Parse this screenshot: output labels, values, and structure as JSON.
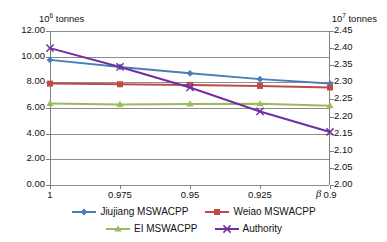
{
  "chart_data": {
    "type": "line",
    "title": "",
    "xlabel": "β",
    "categories": [
      "1",
      "0.975",
      "0.95",
      "0.925",
      "0.9"
    ],
    "x": [
      1,
      0.975,
      0.95,
      0.925,
      0.9
    ],
    "left_axis": {
      "unit_caption": "tonnes",
      "unit_base": "10",
      "unit_exponent": "6",
      "ticks": [
        "12.00",
        "10.00",
        "8.00",
        "6.00",
        "4.00",
        "2.00",
        "0.00"
      ],
      "ylim": [
        0.0,
        12.0
      ],
      "step": 2.0
    },
    "right_axis": {
      "unit_caption": "tonnes",
      "unit_base": "10",
      "unit_exponent": "7",
      "ticks": [
        "2.45",
        "2.40",
        "2.35",
        "2.30",
        "2.25",
        "2.20",
        "2.15",
        "2.10",
        "2.05",
        "2.00"
      ],
      "ylim": [
        2.0,
        2.45
      ],
      "step": 0.05
    },
    "grid": true,
    "legend_position": "bottom",
    "series": [
      {
        "name": "Jiujiang MSWACPP",
        "axis": "left",
        "color": "#4A7EBB",
        "marker": "diamond",
        "values": [
          9.75,
          9.2,
          8.7,
          8.25,
          7.9
        ]
      },
      {
        "name": "Weiao MSWACPP",
        "axis": "left",
        "color": "#BE4B48",
        "marker": "square",
        "values": [
          7.9,
          7.85,
          7.8,
          7.72,
          7.6
        ]
      },
      {
        "name": "EI MSWACPP",
        "axis": "left",
        "color": "#9BBB59",
        "marker": "triangle",
        "values": [
          6.35,
          6.28,
          6.32,
          6.33,
          6.18
        ]
      },
      {
        "name": "Authority",
        "axis": "right",
        "color": "#7030A0",
        "marker": "cross",
        "values": [
          2.4,
          2.345,
          2.285,
          2.215,
          2.155
        ]
      }
    ]
  },
  "axes": {
    "left_unit_base": "10",
    "left_unit_exp": "6",
    "left_unit_word": "tonnes",
    "right_unit_base": "10",
    "right_unit_exp": "7",
    "right_unit_word": "tonnes",
    "x_axis_symbol": "β"
  },
  "legend": {
    "items": [
      {
        "label": "Jiujiang MSWACPP",
        "color": "#4A7EBB"
      },
      {
        "label": "Weiao MSWACPP",
        "color": "#BE4B48"
      },
      {
        "label": "EI MSWACPP",
        "color": "#9BBB59"
      },
      {
        "label": "Authority",
        "color": "#7030A0"
      }
    ]
  }
}
